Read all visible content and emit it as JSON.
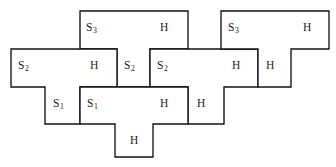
{
  "diagram": {
    "type": "tiling-diagram",
    "canvas": {
      "width": 336,
      "height": 167
    },
    "grid": {
      "cell_width": 37.2,
      "cell_height": 37.8,
      "origin_x": 11,
      "origin_y": 11
    },
    "colors": {
      "stroke": "#111111",
      "fill": "#ffffff",
      "text": "#1a1a1a",
      "background": "#ffffff"
    },
    "pieces": [
      {
        "id": "piece-s3-left",
        "label": "S",
        "subscript": "3",
        "second_label": "H",
        "outline": "M 80 11 L 188 11 L 188 49 L 150 49 L 150 87 L 117 87 L 117 49 L 80 49 Z",
        "label_x": 86,
        "label_y": 23,
        "second_label_x": 160,
        "second_label_y": 23
      },
      {
        "id": "piece-s2-left",
        "label": "S",
        "subscript": "2",
        "second_label": "H",
        "outline": "M 11 49 L 117 49 L 117 87 L 80 87 L 80 124 L 45 124 L 45 87 L 11 87 Z",
        "label_x": 18,
        "label_y": 61,
        "second_label_x": 90,
        "second_label_y": 61
      },
      {
        "id": "piece-s2-right",
        "label": "S",
        "subscript": "2",
        "second_label": "H",
        "outline": "M 150 49 L 258 49 L 258 87 L 224 87 L 224 124 L 188 124 L 188 87 L 150 87 Z",
        "label_x": 157,
        "label_y": 61,
        "second_label_x": 232,
        "second_label_y": 61
      },
      {
        "id": "piece-s3-right",
        "label": "S",
        "subscript": "3",
        "second_label": "H",
        "outline": "M 221 11 L 329 11 L 329 49 L 291 49 L 291 87 L 258 87 L 258 49 L 221 49 Z",
        "label_x": 228,
        "label_y": 23,
        "second_label_x": 300,
        "second_label_y": 23
      },
      {
        "id": "piece-s1-bottom",
        "label": "S",
        "subscript": "1",
        "second_label": "H",
        "outline": "M 80 87 L 188 87 L 188 124 L 153 124 L 153 157 L 115 157 L 115 124 L 80 124 Z",
        "label_x": 87,
        "label_y": 99,
        "second_label_x": 160,
        "second_label_y": 99
      }
    ],
    "labels": [
      {
        "name": "label-s3-top-left",
        "text": "S",
        "sub": "3",
        "x": 86,
        "y": 22
      },
      {
        "name": "label-h-top-left",
        "text": "H",
        "sub": "",
        "x": 160,
        "y": 22
      },
      {
        "name": "label-s3-top-right",
        "text": "S",
        "sub": "3",
        "x": 228,
        "y": 22
      },
      {
        "name": "label-h-top-right",
        "text": "H",
        "sub": "",
        "x": 303,
        "y": 22
      },
      {
        "name": "label-s2-far-left",
        "text": "S",
        "sub": "2",
        "x": 18,
        "y": 60
      },
      {
        "name": "label-h-mid-left",
        "text": "H",
        "sub": "",
        "x": 90,
        "y": 60
      },
      {
        "name": "label-s2-mid-left",
        "text": "S",
        "sub": "2",
        "x": 124,
        "y": 60
      },
      {
        "name": "label-s2-mid-right",
        "text": "S",
        "sub": "2",
        "x": 157,
        "y": 60
      },
      {
        "name": "label-h-mid-right",
        "text": "H",
        "sub": "",
        "x": 232,
        "y": 60
      },
      {
        "name": "label-h-mid-far",
        "text": "H",
        "sub": "",
        "x": 266,
        "y": 60
      },
      {
        "name": "label-s1-left",
        "text": "S",
        "sub": "1",
        "x": 53,
        "y": 98
      },
      {
        "name": "label-s1-right",
        "text": "S",
        "sub": "1",
        "x": 87,
        "y": 98
      },
      {
        "name": "label-h-low-mid",
        "text": "H",
        "sub": "",
        "x": 160,
        "y": 98
      },
      {
        "name": "label-h-low-right",
        "text": "H",
        "sub": "",
        "x": 197,
        "y": 98
      },
      {
        "name": "label-h-bottom",
        "text": "H",
        "sub": "",
        "x": 130,
        "y": 135
      }
    ]
  }
}
